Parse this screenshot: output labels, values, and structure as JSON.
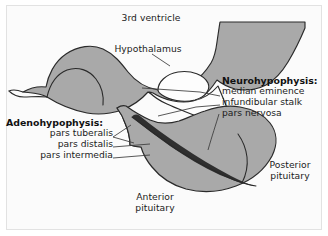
{
  "figure": {
    "background_color": "#fbfbfb",
    "frame_color": "#e2e2e2",
    "tissue_fill": "#a9a9a9",
    "dark_band_fill": "#777777",
    "cavity_fill": "#fdfdfd",
    "outline_color": "#2a2a2a",
    "leader_color": "#3a3a3a"
  },
  "labels": {
    "third_ventricle": "3rd ventricle",
    "hypothalamus": "Hypothalamus",
    "anterior_pituitary": "Anterior\npituitary",
    "posterior_pituitary": "Posterior\npituitary"
  },
  "neurohypophysis": {
    "heading": "Neurohypophysis:",
    "items": [
      "median eminence",
      "infundibular stalk",
      "pars nervosa"
    ]
  },
  "adenohypophysis": {
    "heading": "Adenohypophysis:",
    "items": [
      "pars tuberalis",
      "pars distalis",
      "pars intermedia"
    ]
  }
}
